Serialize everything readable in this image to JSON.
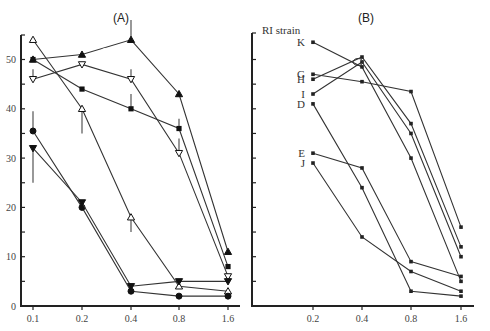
{
  "chart_data": [
    {
      "panel": "A",
      "type": "line",
      "title": "(A)",
      "xlabel": "",
      "ylabel": "",
      "categories": [
        "0.1",
        "0.2",
        "0.4",
        "0.8",
        "1.6"
      ],
      "yticks": [
        "0",
        "10",
        "20",
        "30",
        "40",
        "50"
      ],
      "ylim": [
        0,
        55
      ],
      "grid": false,
      "series": [
        {
          "name": "filled-triangle-up",
          "marker": "triangle-up-filled",
          "values": [
            50,
            51,
            54,
            43,
            11
          ],
          "errors": [
            null,
            null,
            4,
            null,
            null
          ]
        },
        {
          "name": "open-triangle-up",
          "marker": "triangle-up-open",
          "values": [
            54,
            40,
            18,
            4,
            3
          ],
          "errors": [
            null,
            5,
            3,
            null,
            null
          ]
        },
        {
          "name": "open-triangle-down",
          "marker": "triangle-down-open",
          "values": [
            46,
            49,
            46,
            31,
            6
          ],
          "errors": [
            2,
            null,
            2,
            3,
            null
          ]
        },
        {
          "name": "filled-square",
          "marker": "square-filled",
          "values": [
            50,
            44,
            40,
            36,
            8
          ],
          "errors": [
            null,
            null,
            3,
            2,
            null
          ]
        },
        {
          "name": "filled-circle",
          "marker": "circle-filled",
          "values": [
            35.5,
            20,
            3,
            2,
            2
          ],
          "errors": [
            4,
            null,
            null,
            null,
            null
          ]
        },
        {
          "name": "filled-triangle-down",
          "marker": "triangle-down-filled",
          "values": [
            32,
            21,
            4,
            5,
            5
          ],
          "errors": [
            7,
            null,
            null,
            null,
            null
          ]
        }
      ]
    },
    {
      "panel": "B",
      "type": "line",
      "title": "(B)",
      "ylabel": "RI strain",
      "categories": [
        "0.2",
        "0.4",
        "0.8",
        "1.6"
      ],
      "ylim": [
        0,
        55
      ],
      "grid": false,
      "series": [
        {
          "name": "K",
          "values": [
            53.5,
            48.5,
            30,
            5
          ]
        },
        {
          "name": "G",
          "values": [
            47,
            45.5,
            43.5,
            16
          ]
        },
        {
          "name": "H",
          "values": [
            46,
            50.5,
            37,
            12
          ]
        },
        {
          "name": "I",
          "values": [
            43,
            49.5,
            35,
            10
          ]
        },
        {
          "name": "D",
          "values": [
            41,
            24,
            3,
            2
          ]
        },
        {
          "name": "E",
          "values": [
            31,
            28,
            9,
            6
          ]
        },
        {
          "name": "J",
          "values": [
            29,
            14,
            7,
            3
          ]
        }
      ]
    }
  ],
  "labels": {
    "panelA": "(A)",
    "panelB": "(B)",
    "ri_strain": "RI strain"
  }
}
